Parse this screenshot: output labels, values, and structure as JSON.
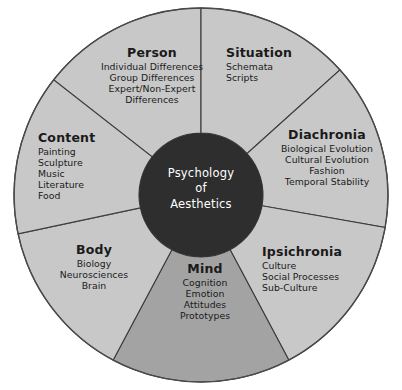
{
  "diagram": {
    "title": "Psychology of Aesthetics",
    "type": "radial-wheel",
    "hub": {
      "line1": "Psychology",
      "line2": "of",
      "line3": "Aesthetics",
      "fill_color": "#2e2e2e",
      "text_color": "#ffffff"
    },
    "colors": {
      "sector_fill": "#c8c8c8",
      "sector_fill_highlight": "#a3a3a3",
      "stroke": "#3b3b3b",
      "background": "#ffffff",
      "text": "#1a1a1a"
    },
    "sectors": [
      {
        "id": "person",
        "label": "Person",
        "items": [
          "Individual Differences",
          "Group Differences",
          "Expert/Non-Expert",
          "Differences"
        ],
        "fill": "#c8c8c8",
        "align": "center",
        "start_angle": -52,
        "end_angle": 0
      },
      {
        "id": "situation",
        "label": "Situation",
        "items": [
          "Schemata",
          "Scripts"
        ],
        "fill": "#c8c8c8",
        "align": "left",
        "start_angle": 0,
        "end_angle": 48
      },
      {
        "id": "diachronia",
        "label": "Diachronia",
        "items": [
          "Biological Evolution",
          "Cultural Evolution",
          "Fashion",
          "Temporal Stability"
        ],
        "fill": "#c8c8c8",
        "align": "center",
        "start_angle": 48,
        "end_angle": 100
      },
      {
        "id": "ipsichronia",
        "label": "Ipsichronia",
        "items": [
          "Culture",
          "Social Processes",
          "Sub-Culture"
        ],
        "fill": "#c8c8c8",
        "align": "left",
        "start_angle": 100,
        "end_angle": 152
      },
      {
        "id": "mind",
        "label": "Mind",
        "items": [
          "Cognition",
          "Emotion",
          "Attitudes",
          "Prototypes"
        ],
        "fill": "#a3a3a3",
        "align": "center",
        "start_angle": 152,
        "end_angle": 208
      },
      {
        "id": "body",
        "label": "Body",
        "items": [
          "Biology",
          "Neurosciences",
          "Brain"
        ],
        "fill": "#c8c8c8",
        "align": "center",
        "start_angle": 208,
        "end_angle": 258
      },
      {
        "id": "content",
        "label": "Content",
        "items": [
          "Painting",
          "Sculpture",
          "Music",
          "Literature",
          "Food"
        ],
        "fill": "#c8c8c8",
        "align": "left",
        "start_angle": 258,
        "end_angle": 308
      }
    ],
    "geometry": {
      "center_x": 201,
      "center_y": 195,
      "outer_radius": 187,
      "hub_radius": 62
    }
  }
}
